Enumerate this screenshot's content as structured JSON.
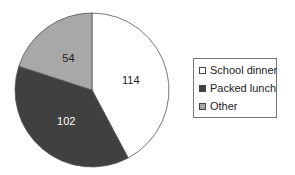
{
  "chart_data": {
    "type": "pie",
    "title": "",
    "categories": [
      "School dinner",
      "Packed lunch",
      "Other"
    ],
    "values": [
      114,
      102,
      54
    ],
    "colors": [
      "#ffffff",
      "#404040",
      "#a8a8a8"
    ],
    "label_colors": [
      "#222222",
      "#ffffff",
      "#222222"
    ],
    "start_angle_deg": 0,
    "direction": "clockwise",
    "legend_position": "right"
  },
  "legend": {
    "items": [
      {
        "label": "School dinner",
        "color": "#ffffff"
      },
      {
        "label": "Packed lunch",
        "color": "#404040"
      },
      {
        "label": "Other",
        "color": "#a8a8a8"
      }
    ]
  }
}
